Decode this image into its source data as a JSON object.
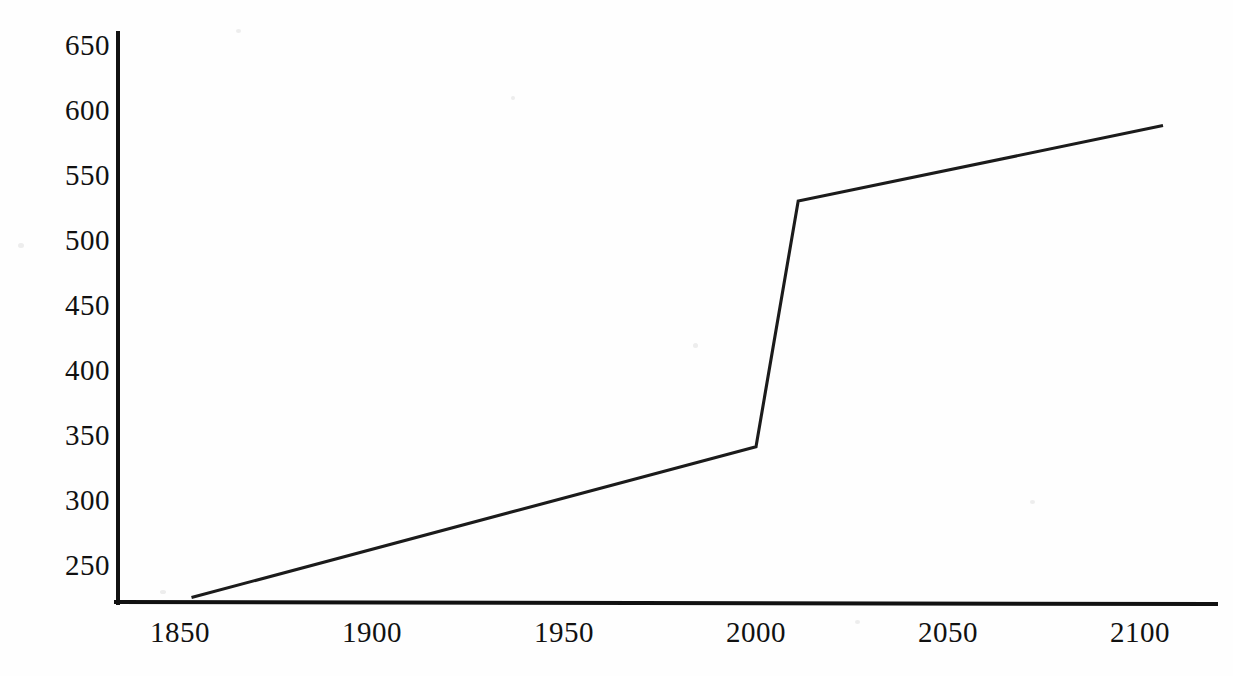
{
  "chart_data": {
    "type": "line",
    "title": "",
    "subtitle": "",
    "xlabel": "",
    "ylabel": "",
    "xlim": [
      1833,
      2120
    ],
    "ylim": [
      220,
      665
    ],
    "grid": false,
    "legend": null,
    "x": [
      1853,
      2000,
      2011,
      2106
    ],
    "series": [
      {
        "name": "",
        "values": [
          225,
          341,
          530,
          588
        ]
      }
    ],
    "xticks": [
      1850,
      1900,
      1950,
      2000,
      2050,
      2100
    ],
    "xtick_labels": [
      "1850",
      "1900",
      "1950",
      "2000",
      "2050",
      "2100"
    ],
    "yticks": [
      250,
      300,
      350,
      400,
      450,
      500,
      550,
      600,
      650
    ],
    "ytick_labels": [
      "250",
      "300",
      "350",
      "400",
      "450",
      "500",
      "550",
      "600",
      "650"
    ],
    "annotations": []
  },
  "style": {
    "line_color": "#1b1b1b",
    "axis_color": "#111111",
    "background_color": "#ffffff",
    "text_color": "#111111"
  }
}
